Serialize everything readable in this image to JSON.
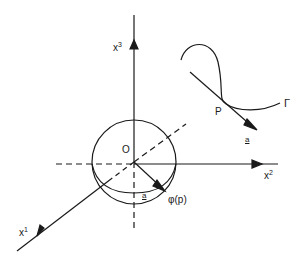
{
  "diagram": {
    "type": "3D coordinate system with unit sphere, curve and tangent vector",
    "axes": [
      {
        "name": "x3",
        "label_base": "x",
        "label_sup": "3",
        "direction": "up"
      },
      {
        "name": "x2",
        "label_base": "x",
        "label_sup": "2",
        "direction": "right"
      },
      {
        "name": "x1",
        "label_base": "x",
        "label_sup": "1",
        "direction": "down-left"
      }
    ],
    "origin_label": "O",
    "sphere_vector_label": "a",
    "sphere_point_label": "φ(p)",
    "curve": {
      "name_label": "Γ",
      "point_label": "P",
      "tangent_label": "a"
    },
    "colors": {
      "ink": "#1a1a1a",
      "background": "#ffffff"
    }
  }
}
